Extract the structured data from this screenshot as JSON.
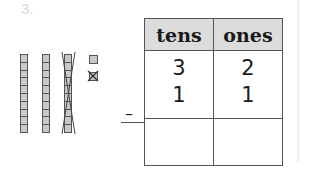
{
  "problem": {
    "number": "3."
  },
  "model": {
    "tens_rods": 3,
    "crossed_rods": 1,
    "ones_cubes": 2,
    "crossed_ones": 1
  },
  "table": {
    "headers": [
      "tens",
      "ones"
    ],
    "minuend": {
      "tens": "3",
      "ones": "2"
    },
    "subtrahend": {
      "tens": "1",
      "ones": "1"
    },
    "operator": "–",
    "answer": {
      "tens": "",
      "ones": ""
    }
  }
}
